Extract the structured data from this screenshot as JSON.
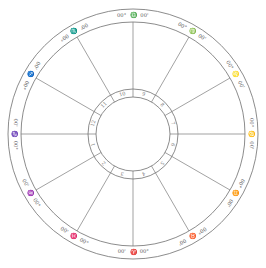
{
  "chart": {
    "center": [
      133,
      134
    ],
    "outer_radius": 125,
    "zodiac_inner_radius": 112,
    "house_ring_outer_radius": 45,
    "house_ring_inner_radius": 37,
    "cusps": [
      {
        "house": 1,
        "angle": 180,
        "sign": "♑",
        "deg": "00°",
        "min": "00'"
      },
      {
        "house": 2,
        "angle": 210,
        "sign": "♒",
        "deg": "00°",
        "min": "00'"
      },
      {
        "house": 3,
        "angle": 240,
        "sign": "♓",
        "deg": "00°",
        "min": "00'"
      },
      {
        "house": 4,
        "angle": 270,
        "sign": "♈",
        "deg": "00°",
        "min": "00'"
      },
      {
        "house": 5,
        "angle": 300,
        "sign": "♉",
        "deg": "00°",
        "min": "00'"
      },
      {
        "house": 6,
        "angle": 330,
        "sign": "♊",
        "deg": "00°",
        "min": "00'"
      },
      {
        "house": 7,
        "angle": 0,
        "sign": "♋",
        "deg": "00°",
        "min": "00'"
      },
      {
        "house": 8,
        "angle": 30,
        "sign": "♌",
        "deg": "00°",
        "min": "00'"
      },
      {
        "house": 9,
        "angle": 60,
        "sign": "♍",
        "deg": "00°",
        "min": "00'"
      },
      {
        "house": 10,
        "angle": 90,
        "sign": "♎",
        "deg": "00°",
        "min": "00'"
      },
      {
        "house": 11,
        "angle": 120,
        "sign": "♏",
        "deg": "00°",
        "min": "00'"
      },
      {
        "house": 12,
        "angle": 150,
        "sign": "♐",
        "deg": "00°",
        "min": "00'"
      }
    ]
  }
}
